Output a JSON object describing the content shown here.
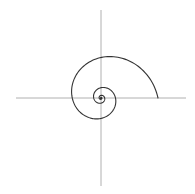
{
  "canvas": {
    "width": 195,
    "height": 194,
    "background": "#ffffff"
  },
  "diagram": {
    "type": "logarithmic-spiral",
    "origin": {
      "x": 101,
      "y": 98
    },
    "axes": {
      "color": "#b0b0b0",
      "stroke_width": 1,
      "horizontal": {
        "x1": 16,
        "x2": 186,
        "y": 98
      },
      "vertical": {
        "x": 101,
        "y1": 10,
        "y2": 186
      }
    },
    "spiral": {
      "color": "#333333",
      "stroke_width": 1.1,
      "start_radius": 57,
      "start_angle_deg": 0,
      "direction": "counterclockwise-inward",
      "decay_per_quarter_turn": 0.71,
      "turns": 4.5,
      "key_points": [
        {
          "label": "outer-end",
          "x": 158,
          "y": 98
        },
        {
          "label": "top-crossing",
          "x": 101,
          "y": 53
        },
        {
          "label": "left-crossing",
          "x": 69,
          "y": 98
        },
        {
          "label": "bottom-crossing",
          "x": 101,
          "y": 121
        },
        {
          "label": "inner-right-crossing",
          "x": 117,
          "y": 98
        },
        {
          "label": "inner-top-crossing",
          "x": 101,
          "y": 86
        },
        {
          "label": "inner-left-crossing",
          "x": 92,
          "y": 98
        }
      ]
    }
  }
}
